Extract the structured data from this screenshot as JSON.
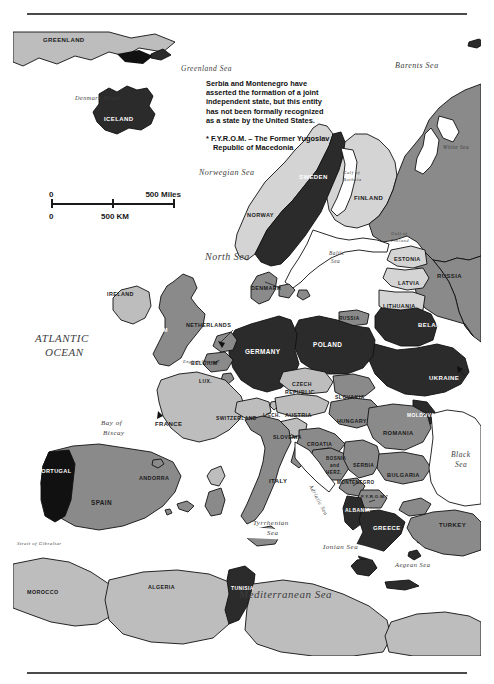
{
  "document": {
    "type": "reference-map",
    "title": "Europe political map"
  },
  "note": {
    "line1": "Serbia and Montenegro have",
    "line2": "asserted the formation of a joint",
    "line3": "independent state, but this entity",
    "line4": "has not been formally recognized",
    "line5": "as a state by the United States.",
    "fyrom_line1": "* F.Y.R.O.M. – The Former Yugoslav",
    "fyrom_line2": "Republic of Macedonia"
  },
  "scale_bar": {
    "zero_top": "0",
    "miles": "500 Miles",
    "zero_bottom": "0",
    "km": "500 KM"
  },
  "legend_colors": {
    "dark_country": "#2b2b2b",
    "black_country": "#111111",
    "medium_country": "#8a8a8a",
    "light_country": "#bdbdbd",
    "pale_country": "#d4d4d4",
    "water": "#ffffff",
    "outline": "#111111",
    "label_light": "#ffffff",
    "label_dark": "#1a1a1a",
    "sea_label": "#3d3d3d"
  },
  "countries": [
    {
      "name": "GREENLAND",
      "shade": "light",
      "x": 50,
      "y": 15
    },
    {
      "name": "ICELAND",
      "shade": "dark",
      "x": 107,
      "y": 96
    },
    {
      "name": "NORWAY",
      "shade": "pale",
      "x": 253,
      "y": 192
    },
    {
      "name": "SWEDEN",
      "shade": "dark",
      "x": 305,
      "y": 154
    },
    {
      "name": "FINLAND",
      "shade": "pale",
      "x": 359,
      "y": 175
    },
    {
      "name": "ESTONIA",
      "shade": "pale",
      "x": 398,
      "y": 236
    },
    {
      "name": "LATVIA",
      "shade": "pale",
      "x": 400,
      "y": 260
    },
    {
      "name": "LITHUANIA",
      "shade": "pale",
      "x": 392,
      "y": 283
    },
    {
      "name": "RUSSIA",
      "shade": "medium",
      "x": 333,
      "y": 294
    },
    {
      "name": "RUSSIA",
      "shade": "medium",
      "x": 443,
      "y": 253
    },
    {
      "name": "BELARUS",
      "shade": "dark",
      "x": 426,
      "y": 302
    },
    {
      "name": "UKRAINE",
      "shade": "dark",
      "x": 437,
      "y": 355
    },
    {
      "name": "MOLDOVA",
      "shade": "dark",
      "x": 414,
      "y": 392
    },
    {
      "name": "POLAND",
      "shade": "dark",
      "x": 318,
      "y": 322
    },
    {
      "name": "GERMANY",
      "shade": "dark",
      "x": 255,
      "y": 329
    },
    {
      "name": "DENMARK",
      "shade": "medium",
      "x": 260,
      "y": 265
    },
    {
      "name": "NETHERLANDS",
      "shade": "medium",
      "x": 203,
      "y": 302
    },
    {
      "name": "BELGIUM",
      "shade": "medium",
      "x": 196,
      "y": 340
    },
    {
      "name": "LUX.",
      "shade": "medium",
      "x": 197,
      "y": 358
    },
    {
      "name": "UNITED KINGDOM",
      "shade": "medium",
      "x": 148,
      "y": 304
    },
    {
      "name": "IRELAND",
      "shade": "light",
      "x": 109,
      "y": 271
    },
    {
      "name": "FRANCE",
      "shade": "light",
      "x": 160,
      "y": 401
    },
    {
      "name": "SWITZERLAND",
      "shade": "light",
      "x": 232,
      "y": 395
    },
    {
      "name": "LIECH.",
      "shade": "light",
      "x": 260,
      "y": 392
    },
    {
      "name": "AUSTRIA",
      "shade": "light",
      "x": 289,
      "y": 392
    },
    {
      "name": "CZECH REPUBLIC",
      "shade": "light",
      "x": 296,
      "y": 364
    },
    {
      "name": "SLOVAKIA",
      "shade": "medium",
      "x": 340,
      "y": 374
    },
    {
      "name": "HUNGARY",
      "shade": "medium",
      "x": 341,
      "y": 398
    },
    {
      "name": "SLOVENIA",
      "shade": "light",
      "x": 278,
      "y": 414
    },
    {
      "name": "CROATIA",
      "shade": "medium",
      "x": 309,
      "y": 421
    },
    {
      "name": "BOSNIA and HERZ.",
      "shade": "medium",
      "x": 325,
      "y": 440
    },
    {
      "name": "SERBIA",
      "shade": "medium",
      "x": 355,
      "y": 442
    },
    {
      "name": "MONTENEGRO",
      "shade": "medium",
      "x": 349,
      "y": 459
    },
    {
      "name": "F.Y.R.O.M.*",
      "shade": "medium",
      "x": 364,
      "y": 473
    },
    {
      "name": "ALBANIA",
      "shade": "dark",
      "x": 351,
      "y": 487
    },
    {
      "name": "GREECE",
      "shade": "dark",
      "x": 379,
      "y": 505
    },
    {
      "name": "BULGARIA",
      "shade": "medium",
      "x": 395,
      "y": 452
    },
    {
      "name": "ROMANIA",
      "shade": "medium",
      "x": 389,
      "y": 410
    },
    {
      "name": "TURKEY",
      "shade": "medium",
      "x": 444,
      "y": 502
    },
    {
      "name": "ITALY",
      "shade": "medium",
      "x": 270,
      "y": 458
    },
    {
      "name": "SPAIN",
      "shade": "medium",
      "x": 92,
      "y": 480
    },
    {
      "name": "PORTUGAL",
      "shade": "black",
      "x": 48,
      "y": 448
    },
    {
      "name": "ANDORRA",
      "shade": "medium",
      "x": 148,
      "y": 455
    },
    {
      "name": "MOROCCO",
      "shade": "light",
      "x": 36,
      "y": 569
    },
    {
      "name": "ALGERIA",
      "shade": "light",
      "x": 153,
      "y": 564
    },
    {
      "name": "TUNISIA",
      "shade": "dark",
      "x": 235,
      "y": 565
    },
    {
      "name": "LIBYA",
      "shade": "light",
      "x": 337,
      "y": 641
    },
    {
      "name": "EGYPT",
      "shade": "light",
      "x": 452,
      "y": 648
    }
  ],
  "water_labels": [
    {
      "name": "Greenland Sea",
      "x": 168,
      "y": 47,
      "size": 7.5
    },
    {
      "name": "Barents Sea",
      "x": 415,
      "y": 44,
      "size": 8
    },
    {
      "name": "Denmark Strait",
      "x": 92,
      "y": 76,
      "size": 6.2
    },
    {
      "name": "White Sea",
      "x": 449,
      "y": 125,
      "size": 5.4
    },
    {
      "name": "Norwegian Sea",
      "x": 219,
      "y": 151,
      "size": 8
    },
    {
      "name": "Gulf of Bothnia",
      "x": 340,
      "y": 152,
      "size": 4.8
    },
    {
      "name": "Gulf of Finland",
      "x": 390,
      "y": 213,
      "size": 4.6
    },
    {
      "name": "North Sea",
      "x": 216,
      "y": 235,
      "size": 9
    },
    {
      "name": "Baltic Sea",
      "x": 328,
      "y": 232,
      "size": 5.4
    },
    {
      "name": "ATLANTIC",
      "x": 52,
      "y": 317,
      "size": 11
    },
    {
      "name": "OCEAN",
      "x": 62,
      "y": 331,
      "size": 11
    },
    {
      "name": "English Channel",
      "x": 178,
      "y": 338,
      "size": 4.4
    },
    {
      "name": "Bay of",
      "x": 103,
      "y": 400,
      "size": 7
    },
    {
      "name": "Biscay",
      "x": 105,
      "y": 409,
      "size": 7
    },
    {
      "name": "Adriatic Sea",
      "x": 304,
      "y": 462,
      "size": 5.6
    },
    {
      "name": "Black",
      "x": 455,
      "y": 432,
      "size": 7.5
    },
    {
      "name": "Sea",
      "x": 459,
      "y": 442,
      "size": 7.5
    },
    {
      "name": "Tyrrhenian",
      "x": 264,
      "y": 500,
      "size": 7
    },
    {
      "name": "Sea",
      "x": 272,
      "y": 510,
      "size": 7
    },
    {
      "name": "Ionian Sea",
      "x": 332,
      "y": 524,
      "size": 7
    },
    {
      "name": "Aegean Sea",
      "x": 410,
      "y": 542,
      "size": 6.5
    },
    {
      "name": "Strait of Gibraltar",
      "x": 27,
      "y": 521,
      "size": 4.8
    },
    {
      "name": "Mediterranean Sea",
      "x": 285,
      "y": 572,
      "size": 11
    }
  ]
}
